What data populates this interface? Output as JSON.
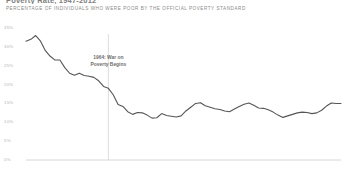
{
  "header": {
    "title_clipped": "Poverty Rate, 1947-2012",
    "subtitle": "PERCENTAGE OF INDIVIDUALS WHO WERE POOR BY THE OFFICIAL POVERTY STANDARD"
  },
  "annotation": {
    "line1": "1964: War on",
    "line2": "Poverty Begins",
    "year": 1964
  },
  "style": {
    "line_color": "#555555",
    "axis_color": "#cccccc",
    "annotation_line_color": "#cfcfcf",
    "label_color": "#b4b4b4",
    "background": "#ffffff"
  },
  "chart_data": {
    "type": "line",
    "title": "Poverty Rate, 1947-2012",
    "subtitle": "PERCENTAGE OF INDIVIDUALS WHO WERE POOR BY THE OFFICIAL POVERTY STANDARD",
    "xlabel": "",
    "ylabel": "",
    "xlim": [
      1947,
      2012
    ],
    "ylim": [
      0,
      35
    ],
    "grid": false,
    "legend": false,
    "ytick_labels": [
      "35%",
      "30%",
      "25%",
      "20%",
      "15%",
      "10%",
      "5%",
      "0%"
    ],
    "ytick_values": [
      35,
      30,
      25,
      20,
      15,
      10,
      5,
      0
    ],
    "xtick_labels": [
      "1947",
      "1950",
      "1955",
      "1960",
      "1965",
      "1970",
      "1975",
      "1980",
      "1985",
      "1990",
      "1995",
      "2000",
      "2005",
      "2010",
      "2012"
    ],
    "xtick_values": [
      1947,
      1950,
      1955,
      1960,
      1965,
      1970,
      1975,
      1980,
      1985,
      1990,
      1995,
      2000,
      2005,
      2010,
      2012
    ],
    "annotations": [
      {
        "x": 1964,
        "text": "1964: War on Poverty Begins",
        "type": "vline"
      }
    ],
    "series": [
      {
        "name": "Poverty rate",
        "color": "#555555",
        "x": [
          1947,
          1948,
          1949,
          1950,
          1951,
          1952,
          1953,
          1954,
          1955,
          1956,
          1957,
          1958,
          1959,
          1960,
          1961,
          1962,
          1963,
          1964,
          1965,
          1966,
          1967,
          1968,
          1969,
          1970,
          1971,
          1972,
          1973,
          1974,
          1975,
          1976,
          1977,
          1978,
          1979,
          1980,
          1981,
          1982,
          1983,
          1984,
          1985,
          1986,
          1987,
          1988,
          1989,
          1990,
          1991,
          1992,
          1993,
          1994,
          1995,
          1996,
          1997,
          1998,
          1999,
          2000,
          2001,
          2002,
          2003,
          2004,
          2005,
          2006,
          2007,
          2008,
          2009,
          2010,
          2011,
          2012
        ],
        "values": [
          31.5,
          32.0,
          33.0,
          31.5,
          29.0,
          27.5,
          26.5,
          26.5,
          24.5,
          23.0,
          22.5,
          23.0,
          22.4,
          22.2,
          21.9,
          21.0,
          19.5,
          19.0,
          17.3,
          14.7,
          14.2,
          12.8,
          12.1,
          12.6,
          12.5,
          11.9,
          11.1,
          11.2,
          12.3,
          11.8,
          11.6,
          11.4,
          11.7,
          13.0,
          14.0,
          15.0,
          15.2,
          14.4,
          14.0,
          13.6,
          13.4,
          13.0,
          12.8,
          13.5,
          14.2,
          14.8,
          15.1,
          14.5,
          13.8,
          13.7,
          13.3,
          12.7,
          11.9,
          11.3,
          11.7,
          12.1,
          12.5,
          12.7,
          12.6,
          12.3,
          12.5,
          13.2,
          14.3,
          15.1,
          15.0,
          15.0
        ]
      }
    ]
  }
}
